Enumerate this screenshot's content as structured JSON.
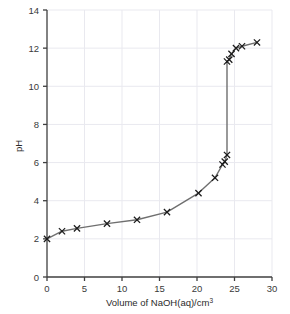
{
  "chart_data": {
    "type": "line",
    "title": "",
    "subtitle": "",
    "xlabel": "Volume of NaOH(aq)/cm3",
    "xlabel_main": "Volume of NaOH(aq)/cm",
    "xlabel_sup": "3",
    "ylabel": "pH",
    "xlim": [
      0,
      30
    ],
    "ylim": [
      0,
      14
    ],
    "xticks": [
      0,
      5,
      10,
      15,
      20,
      25,
      30
    ],
    "yticks": [
      0,
      2,
      4,
      6,
      8,
      10,
      12,
      14
    ],
    "xtick_labels": [
      "0",
      "5",
      "10",
      "15",
      "20",
      "25",
      "30"
    ],
    "ytick_labels": [
      "0",
      "2",
      "4",
      "6",
      "8",
      "10",
      "12",
      "14"
    ],
    "grid": true,
    "legend": "none",
    "marker": "x",
    "series": [
      {
        "name": "Titration curve",
        "x": [
          0.0,
          2.0,
          4.0,
          8.0,
          12.0,
          16.0,
          20.2,
          22.4,
          23.4,
          23.7,
          24.0,
          24.0,
          24.3,
          24.6,
          25.2,
          26.0,
          28.0
        ],
        "y": [
          2.0,
          2.4,
          2.55,
          2.8,
          3.0,
          3.4,
          4.4,
          5.2,
          5.9,
          6.05,
          6.4,
          11.3,
          11.4,
          11.7,
          12.0,
          12.1,
          12.3
        ]
      }
    ],
    "colors": {
      "line": "#6f6f6f",
      "marker": "#1c1c1c",
      "axis": "#3f3f3f",
      "grid": "#e9e9ef",
      "background": "#ffffff"
    },
    "annotations": []
  },
  "geometry": {
    "plot_left": 47,
    "plot_right": 272,
    "plot_top": 10,
    "plot_bottom": 277
  }
}
